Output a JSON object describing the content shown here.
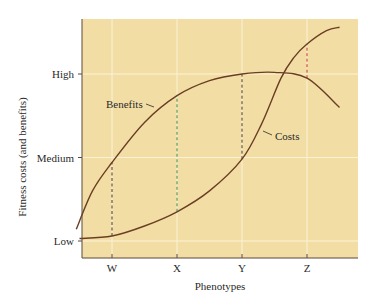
{
  "chart_data": {
    "type": "line",
    "title": "",
    "xlabel": "Phenotypes",
    "ylabel": "Fitness costs (and benefits)",
    "x_categories": [
      "W",
      "X",
      "Y",
      "Z"
    ],
    "y_tick_labels": [
      "Low",
      "Medium",
      "High"
    ],
    "y_tick_values": [
      0,
      1,
      2
    ],
    "ylim": [
      -0.2,
      2.65
    ],
    "xlim": [
      0.45,
      4.85
    ],
    "grid": true,
    "legend": "inline labels",
    "series": [
      {
        "name": "Benefits",
        "x": [
          0.45,
          0.7,
          1.0,
          1.5,
          2.0,
          2.5,
          3.0,
          3.5,
          4.0,
          4.5
        ],
        "values": [
          0.14,
          0.6,
          0.94,
          1.42,
          1.74,
          1.92,
          2.0,
          2.02,
          1.95,
          1.6
        ]
      },
      {
        "name": "Costs",
        "x": [
          0.5,
          1.0,
          1.5,
          2.0,
          2.5,
          3.0,
          3.3,
          3.6,
          3.8,
          4.0,
          4.3,
          4.5
        ],
        "values": [
          0.03,
          0.06,
          0.18,
          0.35,
          0.6,
          0.98,
          1.4,
          1.95,
          2.2,
          2.36,
          2.52,
          2.56
        ]
      }
    ],
    "annotations": [
      {
        "type": "dashed-vline",
        "x": "W",
        "from": 0.06,
        "to": 0.94,
        "color": "#4a3a2a"
      },
      {
        "type": "dashed-vline",
        "x": "X",
        "from": 0.35,
        "to": 1.74,
        "color": "#3f8a3f"
      },
      {
        "type": "dashed-vline",
        "x": "Y",
        "from": 0.98,
        "to": 2.0,
        "color": "#4a3a2a"
      },
      {
        "type": "dashed-vline",
        "x": "Z",
        "from": 1.95,
        "to": 2.36,
        "color": "#c0392b"
      }
    ]
  },
  "colors": {
    "plot_background": "#f2dea4",
    "gridline": "#fbf2d6",
    "curve": "#6b3e24",
    "axis": "#5a4a3a"
  },
  "labels": {
    "benefits": "Benefits",
    "costs": "Costs"
  }
}
